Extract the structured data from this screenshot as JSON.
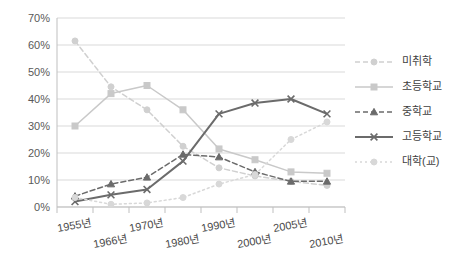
{
  "chart_data": {
    "type": "line",
    "title": "",
    "subtitle": "",
    "xlabel": "",
    "ylabel": "",
    "ylim": [
      0,
      70
    ],
    "ytick_labels": [
      "0%",
      "10%",
      "20%",
      "30%",
      "40%",
      "50%",
      "60%",
      "70%"
    ],
    "ytick_values": [
      0,
      10,
      20,
      30,
      40,
      50,
      60,
      70
    ],
    "grid": true,
    "legend_position": "right",
    "categories": [
      "1955년",
      "1966년",
      "1970년",
      "1980년",
      "1990년",
      "2000년",
      "2005년",
      "2010년"
    ],
    "x": [
      "1955년",
      "1966년",
      "1970년",
      "1975년",
      "1980년",
      "1985년",
      "1990년",
      "1995년",
      "2000년",
      "2005년",
      "2010년"
    ],
    "x_tick_labels": [
      "1955년",
      "1966년",
      "1970년",
      "1980년",
      "1990년",
      "2000년",
      "2005년",
      "2010년"
    ],
    "series": [
      {
        "name": "미취학",
        "color": "#d0d0d0",
        "style": "dashed",
        "marker": "circle",
        "values": [
          61.5,
          44.5,
          36.0,
          22.5,
          14.5,
          11.5,
          9.5,
          8.0
        ]
      },
      {
        "name": "초등학교",
        "color": "#c9c9c9",
        "style": "solid",
        "marker": "square",
        "values": [
          30.0,
          42.0,
          45.0,
          36.0,
          21.5,
          17.5,
          13.0,
          12.5
        ]
      },
      {
        "name": "중학교",
        "color": "#6b6b6b",
        "style": "dashed",
        "marker": "triangle",
        "values": [
          4.0,
          8.5,
          11.0,
          19.5,
          18.5,
          13.0,
          9.5,
          9.5
        ]
      },
      {
        "name": "고등학교",
        "color": "#6b6b6b",
        "style": "solid",
        "marker": "cross",
        "values": [
          2.0,
          4.5,
          6.5,
          17.0,
          34.5,
          38.5,
          40.0,
          34.5
        ]
      },
      {
        "name": "대학(교)",
        "color": "#d8d8d8",
        "style": "dotted",
        "marker": "circle",
        "values": [
          3.5,
          1.0,
          1.5,
          3.5,
          8.5,
          12.0,
          25.0,
          31.5
        ]
      }
    ]
  },
  "legend": {
    "items": [
      {
        "label": "미취학"
      },
      {
        "label": "초등학교"
      },
      {
        "label": "중학교"
      },
      {
        "label": "고등학교"
      },
      {
        "label": "대학(교)"
      }
    ]
  },
  "axes": {
    "y_labels": [
      "70%",
      "60%",
      "50%",
      "40%",
      "30%",
      "20%",
      "10%",
      "0%"
    ],
    "x_labels_top": [
      "1955년",
      "1970년",
      "1990년",
      "2005년"
    ],
    "x_labels_bottom": [
      "1966년",
      "1980년",
      "2000년",
      "2010년"
    ]
  }
}
